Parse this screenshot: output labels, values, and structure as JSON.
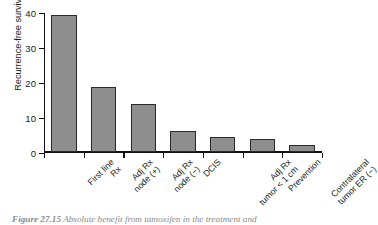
{
  "chart_data": {
    "type": "bar",
    "title": "",
    "xlabel": "",
    "ylabel": "Recurrence-free survival (%)",
    "ylim": [
      0,
      40
    ],
    "yticks": [
      0,
      10,
      20,
      30,
      40
    ],
    "grid": false,
    "legend": null,
    "bar_color": "#8e8e8e",
    "bar_edge_color": "#2a2a2a",
    "categories": [
      "First line Rx",
      "Adj Rx node (+)",
      "Adj Rx node (−)",
      "DCIS",
      "Adj Rx tumor < 1 cm",
      "Prevention",
      "Contralateral tumor ER (−)"
    ],
    "category_lines": [
      [
        "First line",
        "Rx"
      ],
      [
        "Adj Rx",
        "node (+)"
      ],
      [
        "Adj Rx",
        "node (−)"
      ],
      [
        "DCIS",
        ""
      ],
      [
        "Adj Rx",
        "tumor < 1 cm"
      ],
      [
        "Prevention",
        ""
      ],
      [
        "Contralateral",
        "tumor ER (−)"
      ]
    ],
    "values": [
      39.2,
      18.6,
      13.6,
      6.1,
      4.4,
      3.6,
      2.1
    ]
  },
  "axis": {
    "tick_labels": [
      "40",
      "30",
      "20",
      "10",
      "0"
    ],
    "y_title": "Recurrence-free survival (%)"
  },
  "caption": {
    "figure_number": "Figure 27.15",
    "text": "Absolute benefit from tamoxifen in the treatment and"
  }
}
